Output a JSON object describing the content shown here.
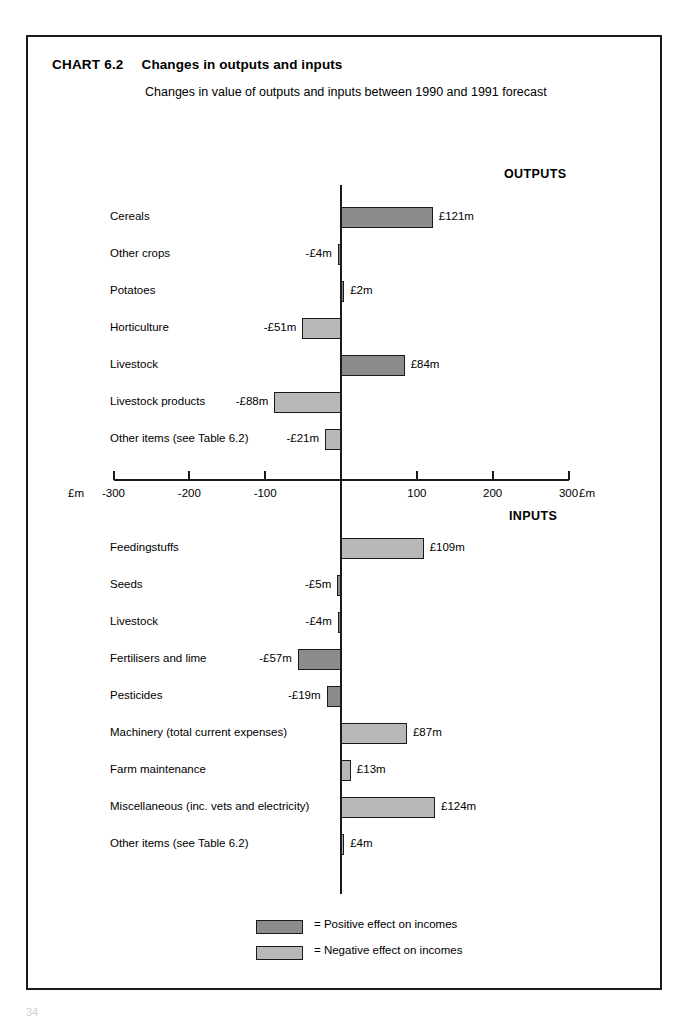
{
  "frame": {
    "chart_number": "CHART 6.2",
    "title": "Changes in outputs and inputs",
    "subtitle": "Changes in value of outputs and inputs between 1990 and 1991 forecast"
  },
  "sections": {
    "outputs_heading": "OUTPUTS",
    "inputs_heading": "INPUTS"
  },
  "axis": {
    "unit_left": "£m",
    "unit_right": "£m",
    "ticks": [
      "-300",
      "-200",
      "-100",
      "100",
      "200",
      "300"
    ]
  },
  "legend": {
    "positive_label": "= Positive effect on incomes",
    "negative_label": "= Negative effect on incomes",
    "positive_color": "#8c8c8c",
    "negative_color": "#b8b8b8"
  },
  "page_number": "34",
  "chart_data": {
    "type": "bar",
    "orientation": "horizontal",
    "title": "Changes in outputs and inputs",
    "subtitle": "Changes in value of outputs and inputs between 1990 and 1991 forecast",
    "xlabel": "£m",
    "ylabel": "",
    "xlim": [
      -300,
      300
    ],
    "xticks": [
      -300,
      -200,
      -100,
      0,
      100,
      200,
      300
    ],
    "grid": false,
    "legend_position": "bottom-center",
    "legend": [
      {
        "name": "Positive effect on incomes",
        "color": "#8c8c8c"
      },
      {
        "name": "Negative effect on incomes",
        "color": "#b8b8b8"
      }
    ],
    "panels": [
      {
        "name": "OUTPUTS",
        "categories": [
          "Cereals",
          "Other crops",
          "Potatoes",
          "Horticulture",
          "Livestock",
          "Livestock products",
          "Other items (see Table 6.2)"
        ],
        "values": [
          121,
          -4,
          2,
          -51,
          84,
          -88,
          -21
        ],
        "labels": [
          "£121m",
          "-£4m",
          "£2m",
          "-£51m",
          "£84m",
          "-£88m",
          "-£21m"
        ],
        "effects": [
          "positive",
          "positive",
          "positive",
          "negative",
          "positive",
          "negative",
          "negative"
        ]
      },
      {
        "name": "INPUTS",
        "categories": [
          "Feedingstuffs",
          "Seeds",
          "Livestock",
          "Fertilisers and lime",
          "Pesticides",
          "Machinery (total current expenses)",
          "Farm maintenance",
          "Miscellaneous (inc. vets and electricity)",
          "Other items (see Table 6.2)"
        ],
        "values": [
          109,
          -5,
          -4,
          -57,
          -19,
          87,
          13,
          124,
          4
        ],
        "labels": [
          "£109m",
          "-£5m",
          "-£4m",
          "-£57m",
          "-£19m",
          "£87m",
          "£13m",
          "£124m",
          "£4m"
        ],
        "effects": [
          "negative",
          "positive",
          "positive",
          "positive",
          "positive",
          "negative",
          "negative",
          "negative",
          "negative"
        ]
      }
    ]
  }
}
